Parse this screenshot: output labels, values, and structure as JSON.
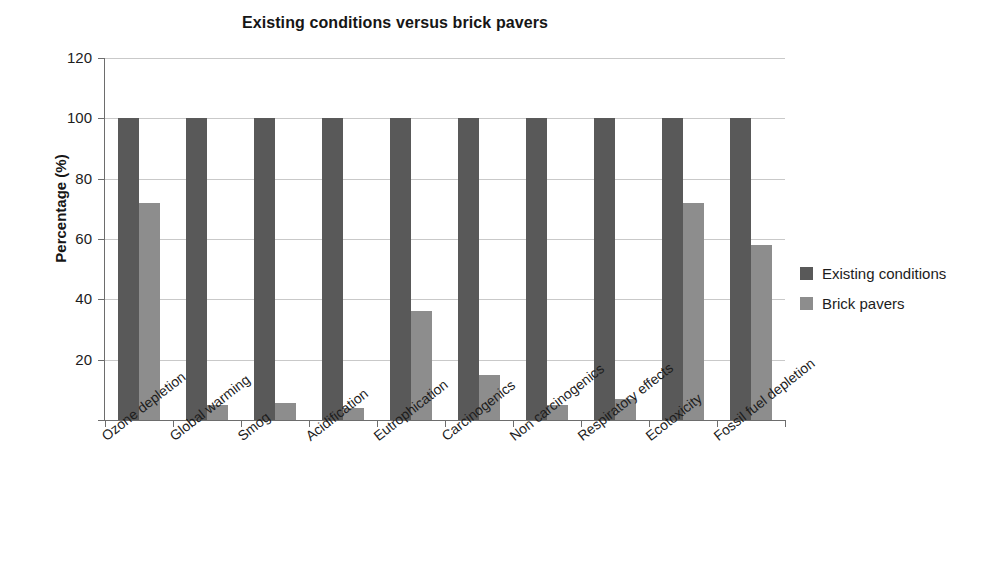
{
  "chart_data": {
    "type": "bar",
    "title": "Existing conditions versus brick pavers",
    "xlabel": "",
    "ylabel": "Percentage (%)",
    "ylim": [
      0,
      120
    ],
    "yticks": [
      0,
      20,
      40,
      60,
      80,
      100,
      120
    ],
    "ytick_labels": [
      "",
      "20",
      "40",
      "60",
      "80",
      "100",
      "120"
    ],
    "grid": true,
    "legend_position": "right",
    "categories": [
      "Ozone depletion",
      "Global warming",
      "Smog",
      "Acidification",
      "Eutrophication",
      "Carcinogenics",
      "Non carcinogenics",
      "Respiratory effects",
      "Ecotoxicity",
      "Fossil fuel depletion"
    ],
    "series": [
      {
        "name": "Existing conditions",
        "color": "#595959",
        "values": [
          100,
          100,
          100,
          100,
          100,
          100,
          100,
          100,
          100,
          100
        ]
      },
      {
        "name": "Brick pavers",
        "color": "#8d8d8d",
        "values": [
          72,
          5,
          5.5,
          4,
          36,
          15,
          5,
          7,
          72,
          58
        ]
      }
    ]
  },
  "legend": {
    "entries": [
      {
        "label": "Existing conditions",
        "swatch": "series-existing"
      },
      {
        "label": "Brick pavers",
        "swatch": "series-brick"
      }
    ]
  },
  "colors": {
    "existing_conditions": "#595959",
    "brick_pavers": "#8d8d8d",
    "gridline": "#c9c9c9",
    "axis": "#6d6d6d",
    "text": "#1c1c1c",
    "background": "#ffffff"
  }
}
